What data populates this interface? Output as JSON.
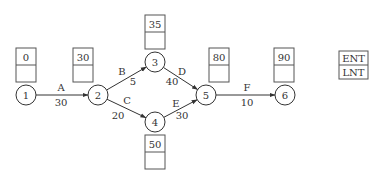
{
  "diagram": {
    "type": "activity-on-arrow network",
    "colors": {
      "stroke": "#333333",
      "text": "#333333",
      "background": "#ffffff"
    },
    "nodes": [
      {
        "id": "1",
        "label": "1",
        "cx": 26,
        "cy": 95,
        "ent": "0",
        "lnt": "",
        "box_x": 16,
        "box_y": 48
      },
      {
        "id": "2",
        "label": "2",
        "cx": 98,
        "cy": 95,
        "ent": "30",
        "lnt": "",
        "box_x": 73,
        "box_y": 48
      },
      {
        "id": "3",
        "label": "3",
        "cx": 155,
        "cy": 62,
        "ent": "35",
        "lnt": "",
        "box_x": 145,
        "box_y": 15
      },
      {
        "id": "4",
        "label": "4",
        "cx": 155,
        "cy": 122,
        "ent": "50",
        "lnt": "",
        "box_x": 145,
        "box_y": 135
      },
      {
        "id": "5",
        "label": "5",
        "cx": 206,
        "cy": 95,
        "ent": "80",
        "lnt": "",
        "box_x": 209,
        "box_y": 48
      },
      {
        "id": "6",
        "label": "6",
        "cx": 285,
        "cy": 95,
        "ent": "90",
        "lnt": "",
        "box_x": 274,
        "box_y": 48
      }
    ],
    "activities": [
      {
        "name": "A",
        "duration": "30",
        "from": "1",
        "to": "2",
        "name_x": 61,
        "name_y": 91,
        "dur_x": 61,
        "dur_y": 106
      },
      {
        "name": "B",
        "duration": "5",
        "from": "2",
        "to": "3",
        "name_x": 122,
        "name_y": 75,
        "dur_x": 133,
        "dur_y": 85
      },
      {
        "name": "C",
        "duration": "20",
        "from": "2",
        "to": "4",
        "name_x": 127,
        "name_y": 104,
        "dur_x": 118,
        "dur_y": 119
      },
      {
        "name": "D",
        "duration": "40",
        "from": "3",
        "to": "5",
        "name_x": 182,
        "name_y": 75,
        "dur_x": 172,
        "dur_y": 85
      },
      {
        "name": "E",
        "duration": "30",
        "from": "4",
        "to": "5",
        "name_x": 176,
        "name_y": 107,
        "dur_x": 182,
        "dur_y": 119
      },
      {
        "name": "F",
        "duration": "10",
        "from": "5",
        "to": "6",
        "name_x": 247,
        "name_y": 91,
        "dur_x": 247,
        "dur_y": 106
      }
    ],
    "legend": {
      "top_label": "ENT",
      "bottom_label": "LNT",
      "x": 339,
      "y": 51
    }
  }
}
